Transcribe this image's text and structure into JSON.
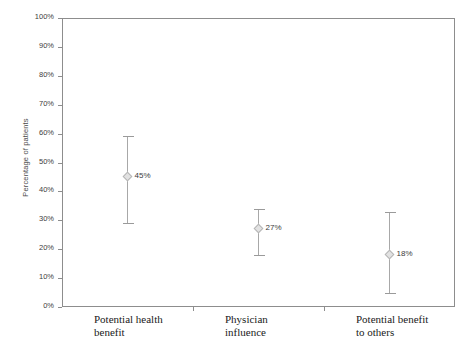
{
  "chart_data": {
    "type": "scatter",
    "title": "",
    "xlabel": "",
    "ylabel": "Percentage of patients",
    "ylim": [
      0,
      100
    ],
    "grid": false,
    "legend": "none",
    "y_ticks": [
      "0%",
      "10%",
      "20%",
      "30%",
      "40%",
      "50%",
      "60%",
      "70%",
      "80%",
      "90%",
      "100%"
    ],
    "y_tick_values": [
      0,
      10,
      20,
      30,
      40,
      50,
      60,
      70,
      80,
      90,
      100
    ],
    "categories": [
      "Potential health benefit",
      "Physician influence",
      "Potential benefit to others"
    ],
    "category_lines": [
      [
        "Potential health",
        "benefit"
      ],
      [
        "Physician",
        "influence"
      ],
      [
        "Potential benefit",
        "to others"
      ]
    ],
    "values": [
      45,
      27,
      18
    ],
    "value_labels": [
      "45%",
      "27%",
      "18%"
    ],
    "error_low": [
      29,
      18,
      5
    ],
    "error_high": [
      59,
      34,
      33
    ],
    "marker_color": "#e2e2e2",
    "errorbar_color": "#a8a8a8",
    "axis_color": "#8d8d8d",
    "text_color": "#3d3d3d",
    "background_color": "#ffffff"
  }
}
